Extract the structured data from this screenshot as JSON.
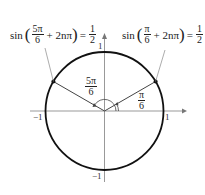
{
  "equations": {
    "left": {
      "func": "sin",
      "arg_num": "5π",
      "arg_den": "6",
      "plus": "+ 2nπ",
      "equals": "=",
      "rhs_num": "1",
      "rhs_den": "2"
    },
    "right": {
      "func": "sin",
      "arg_num": "π",
      "arg_den": "6",
      "plus": "+ 2nπ",
      "equals": "=",
      "rhs_num": "1",
      "rhs_den": "2"
    }
  },
  "angles": {
    "left": {
      "num": "5π",
      "den": "6"
    },
    "right": {
      "num": "π",
      "den": "6"
    }
  },
  "ticks": {
    "x_neg": "−1",
    "x_pos": "1",
    "y_pos": "1",
    "y_neg": "−1"
  },
  "colors": {
    "circle": "#111111",
    "axis": "#888888",
    "line": "#333333"
  }
}
